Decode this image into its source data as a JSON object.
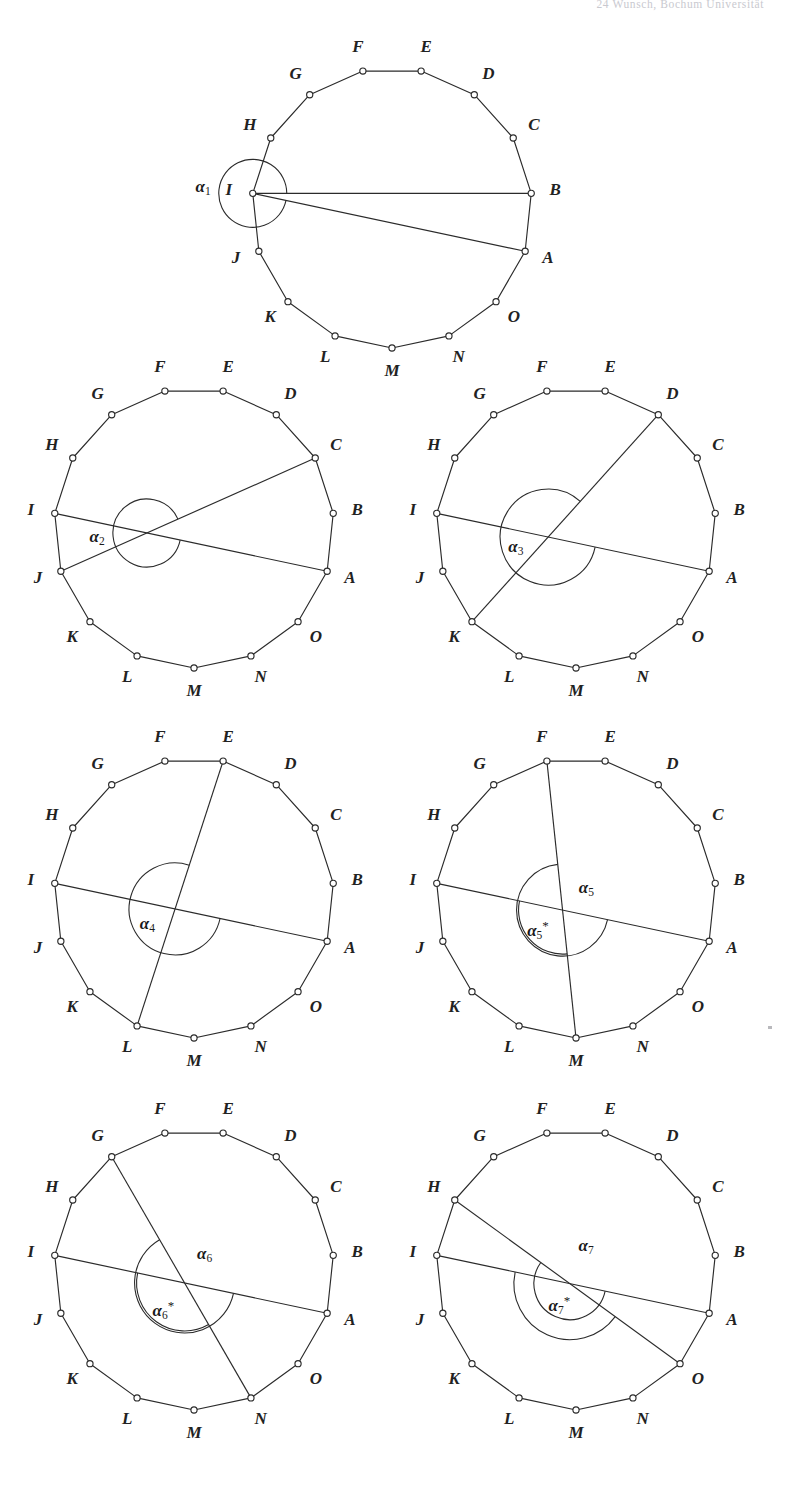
{
  "running_head": "24     Wunsch, Bochum Universität",
  "figure": {
    "polygon_sides": 15,
    "vertex_labels": [
      "A",
      "B",
      "C",
      "D",
      "E",
      "F",
      "G",
      "H",
      "I",
      "J",
      "K",
      "L",
      "M",
      "N",
      "O"
    ],
    "vertex_marker": "open-circle",
    "stroke_color": "#2b2b2b",
    "background_color": "#ffffff",
    "label_count": 15
  },
  "panels": [
    {
      "id": "panel-1",
      "angle_label": "α",
      "angle_sub": "1",
      "angles": [
        {
          "name": "alpha-1",
          "text": "α",
          "sub": "1",
          "star": false
        }
      ],
      "fixed_chord": {
        "from": "I",
        "to": "A"
      },
      "second_chord": {
        "from": "I",
        "to": "B"
      },
      "vertex_order_from_top": [
        "F",
        "E",
        "D",
        "C",
        "B",
        "A",
        "O",
        "N",
        "M",
        "L",
        "K",
        "J",
        "I",
        "H",
        "G"
      ]
    },
    {
      "id": "panel-2",
      "angle_label": "α",
      "angle_sub": "2",
      "angles": [
        {
          "name": "alpha-2",
          "text": "α",
          "sub": "2",
          "star": false
        }
      ],
      "fixed_chord": {
        "from": "I",
        "to": "A"
      },
      "second_chord": {
        "from": "J",
        "to": "C"
      }
    },
    {
      "id": "panel-3",
      "angle_label": "α",
      "angle_sub": "3",
      "angles": [
        {
          "name": "alpha-3",
          "text": "α",
          "sub": "3",
          "star": false
        }
      ],
      "fixed_chord": {
        "from": "I",
        "to": "A"
      },
      "second_chord": {
        "from": "K",
        "to": "D"
      }
    },
    {
      "id": "panel-4",
      "angle_label": "α",
      "angle_sub": "4",
      "angles": [
        {
          "name": "alpha-4",
          "text": "α",
          "sub": "4",
          "star": false
        }
      ],
      "fixed_chord": {
        "from": "I",
        "to": "A"
      },
      "second_chord": {
        "from": "L",
        "to": "E"
      }
    },
    {
      "id": "panel-5",
      "angle_label": "α",
      "angle_sub": "5",
      "angles": [
        {
          "name": "alpha-5-star",
          "text": "α",
          "sub": "5",
          "star": true
        },
        {
          "name": "alpha-5",
          "text": "α",
          "sub": "5",
          "star": false
        }
      ],
      "fixed_chord": {
        "from": "I",
        "to": "A"
      },
      "second_chord": {
        "from": "M",
        "to": "F"
      }
    },
    {
      "id": "panel-6",
      "angle_label": "α",
      "angle_sub": "6",
      "angles": [
        {
          "name": "alpha-6-star",
          "text": "α",
          "sub": "6",
          "star": true
        },
        {
          "name": "alpha-6",
          "text": "α",
          "sub": "6",
          "star": false
        }
      ],
      "fixed_chord": {
        "from": "I",
        "to": "A"
      },
      "second_chord": {
        "from": "N",
        "to": "G"
      }
    },
    {
      "id": "panel-7",
      "angle_label": "α",
      "angle_sub": "7",
      "angles": [
        {
          "name": "alpha-7-star",
          "text": "α",
          "sub": "7",
          "star": true
        },
        {
          "name": "alpha-7",
          "text": "α",
          "sub": "7",
          "star": false
        }
      ],
      "fixed_chord": {
        "from": "I",
        "to": "A"
      },
      "second_chord": {
        "from": "O",
        "to": "H"
      }
    }
  ]
}
